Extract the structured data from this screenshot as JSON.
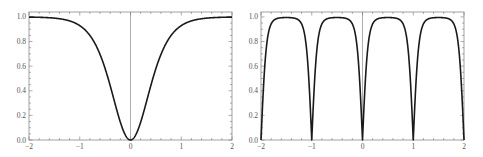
{
  "chart_data": [
    {
      "type": "line",
      "title": "",
      "xlabel": "",
      "ylabel": "",
      "xlim": [
        -2,
        2
      ],
      "ylim": [
        0,
        1.04
      ],
      "grid": false,
      "x_ticks": [
        "-2",
        "-1",
        "0",
        "1",
        "2"
      ],
      "y_ticks": [
        "0.0",
        "0.2",
        "0.4",
        "0.6",
        "0.8",
        "1.0"
      ],
      "axis_line_at_x": 0,
      "series": [
        {
          "name": "curve",
          "color": "#1a1a1a",
          "x": [
            -2,
            -1.5,
            -1.2,
            -1.0,
            -0.8,
            -0.6,
            -0.5,
            -0.4,
            -0.3,
            -0.2,
            -0.1,
            0,
            0.1,
            0.2,
            0.3,
            0.4,
            0.5,
            0.6,
            0.8,
            1.0,
            1.2,
            1.5,
            2
          ],
          "y": [
            1.0,
            0.99,
            0.97,
            0.93,
            0.85,
            0.71,
            0.58,
            0.44,
            0.29,
            0.15,
            0.04,
            0.0,
            0.04,
            0.15,
            0.29,
            0.44,
            0.58,
            0.71,
            0.85,
            0.93,
            0.97,
            0.99,
            1.0
          ]
        }
      ]
    },
    {
      "type": "line",
      "title": "",
      "xlabel": "",
      "ylabel": "",
      "xlim": [
        -2,
        2
      ],
      "ylim": [
        0,
        1.04
      ],
      "grid": false,
      "x_ticks": [
        "-2",
        "-1",
        "0",
        "1",
        "2"
      ],
      "y_ticks": [
        "0.0",
        "0.2",
        "0.4",
        "0.6",
        "0.8",
        "1.0"
      ],
      "axis_line_at_x": 0,
      "series": [
        {
          "name": "periodic curve",
          "color": "#1a1a1a",
          "period": 1,
          "zeros_at": [
            -2,
            -1,
            0,
            1,
            2
          ],
          "x": [
            -2,
            -1.95,
            -1.9,
            -1.8,
            -1.7,
            -1.6,
            -1.5,
            -1.4,
            -1.3,
            -1.2,
            -1.1,
            -1.05,
            -1
          ],
          "y": [
            0.0,
            0.43,
            0.73,
            0.95,
            0.99,
            1.0,
            1.0,
            1.0,
            0.99,
            0.95,
            0.73,
            0.43,
            0.0
          ]
        }
      ]
    }
  ],
  "plots": {
    "left": {
      "name": "left-plot"
    },
    "right": {
      "name": "right-plot"
    }
  }
}
